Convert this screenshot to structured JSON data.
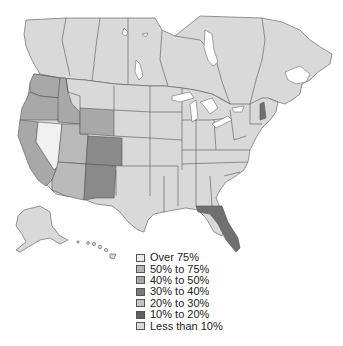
{
  "map": {
    "title": "",
    "region": "United States and Canada",
    "colors": {
      "over_75": "#e6e6e6",
      "50_to_75": "#b9b9b9",
      "40_to_50": "#a8a8a8",
      "30_to_40": "#8a8a8a",
      "20_to_30": "#c8c8c8",
      "10_to_20": "#707070",
      "less_than_10": "#d6d6d6",
      "canada": "#d9d9d9",
      "water": "#ffffff"
    },
    "highlighted_regions": [
      {
        "name": "Nevada",
        "category": "Over 75%"
      },
      {
        "name": "California",
        "category": "40% to 50%"
      },
      {
        "name": "Oregon",
        "category": "40% to 50%"
      },
      {
        "name": "Washington",
        "category": "40% to 50%"
      },
      {
        "name": "Idaho",
        "category": "40% to 50%"
      },
      {
        "name": "Wyoming",
        "category": "40% to 50%"
      },
      {
        "name": "Utah",
        "category": "50% to 75%"
      },
      {
        "name": "Arizona",
        "category": "50% to 75%"
      },
      {
        "name": "Colorado",
        "category": "30% to 40%"
      },
      {
        "name": "New Mexico",
        "category": "30% to 40%"
      },
      {
        "name": "Florida",
        "category": "10% to 20%"
      },
      {
        "name": "New Hampshire",
        "category": "10% to 20%"
      }
    ]
  },
  "legend": {
    "items": [
      {
        "label": "Over 75%",
        "color": "#ececec"
      },
      {
        "label": "50% to 75%",
        "color": "#b5b5b5"
      },
      {
        "label": "40% to 50%",
        "color": "#a6a6a6"
      },
      {
        "label": "30% to 40%",
        "color": "#7a7a7a"
      },
      {
        "label": "20% to 30%",
        "color": "#c4c4c4"
      },
      {
        "label": "10% to 20%",
        "color": "#5f5f5f"
      },
      {
        "label": "Less than 10%",
        "color": "#d9d9d9"
      }
    ]
  }
}
